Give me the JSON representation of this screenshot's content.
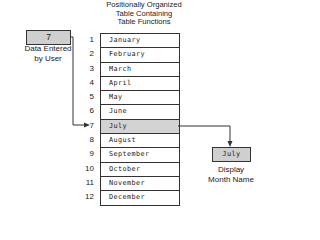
{
  "title": {
    "lines": [
      "Positionally Organized",
      "Table Containing",
      "Table Functions"
    ]
  },
  "input": {
    "value": "7",
    "label_lines": [
      "Data Entered",
      "by User"
    ]
  },
  "table": {
    "highlight_index": 7,
    "rows": [
      {
        "index": "1",
        "value": "January"
      },
      {
        "index": "2",
        "value": "February"
      },
      {
        "index": "3",
        "value": "March"
      },
      {
        "index": "4",
        "value": "April"
      },
      {
        "index": "5",
        "value": "May"
      },
      {
        "index": "6",
        "value": "June"
      },
      {
        "index": "7",
        "value": "July"
      },
      {
        "index": "8",
        "value": "August"
      },
      {
        "index": "9",
        "value": "September"
      },
      {
        "index": "10",
        "value": "October"
      },
      {
        "index": "11",
        "value": "November"
      },
      {
        "index": "12",
        "value": "December"
      }
    ]
  },
  "output": {
    "value": "July",
    "label_lines": [
      "Display",
      "Month Name"
    ]
  },
  "colors": {
    "box_fill": "#cfcfcf",
    "highlight_fill": "#d3d3d3",
    "line": "#333333"
  }
}
